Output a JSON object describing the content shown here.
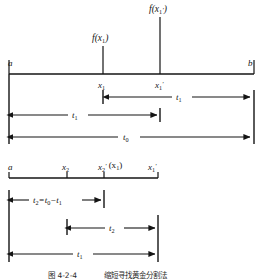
{
  "figure": {
    "caption_label": "图 4-2-4",
    "caption_text": "缩短寻找黄金分割法",
    "diagrams": [
      {
        "id": "upper-interval",
        "endpoints": {
          "left": "a",
          "right": "b"
        },
        "interior_points": [
          {
            "name": "x1",
            "base": "x",
            "sub": "1",
            "prime": ""
          },
          {
            "name": "x1-prime",
            "base": "x",
            "sub": "1",
            "prime": "′"
          }
        ],
        "function_labels": [
          {
            "name": "f-x1",
            "base": "f(x",
            "sub": "1",
            "prime": "",
            "close": ")"
          },
          {
            "name": "f-x1-prime",
            "base": "f(x",
            "sub": "1",
            "prime": "′",
            "close": ")"
          }
        ],
        "measures": [
          {
            "name": "t1-right",
            "base": "t",
            "sub": "1",
            "from": "x1",
            "to": "b"
          },
          {
            "name": "t1-left",
            "base": "t",
            "sub": "1",
            "from": "a",
            "to": "x1-prime"
          },
          {
            "name": "t0-full",
            "base": "t",
            "sub": "0",
            "from": "a",
            "to": "b"
          }
        ]
      },
      {
        "id": "lower-interval",
        "endpoints": {
          "left": "a",
          "right": "x1-prime"
        },
        "interior_points": [
          {
            "name": "x2",
            "base": "x",
            "sub": "2",
            "prime": ""
          },
          {
            "name": "x2-prime",
            "base": "x",
            "sub": "2",
            "prime": "′",
            "annotation": "(x₁)"
          },
          {
            "name": "x1-prime",
            "base": "x",
            "sub": "1",
            "prime": "′"
          }
        ],
        "measures": [
          {
            "name": "t2-equation",
            "text": "t₂=t₀−t₁",
            "from": "a",
            "to": "x2-prime"
          },
          {
            "name": "t2-span",
            "base": "t",
            "sub": "2",
            "from": "x2",
            "to": "x1-prime"
          },
          {
            "name": "t1-span",
            "base": "t",
            "sub": "1",
            "from": "a",
            "to": "x1-prime"
          }
        ]
      }
    ]
  },
  "text": {
    "a": "a",
    "b": "b",
    "f_open": "f(x",
    "close_paren": ")",
    "prime": "′",
    "t": "t",
    "x": "x",
    "sub_0": "0",
    "sub_1": "1",
    "sub_2": "2",
    "t2_equation_main": "t",
    "t2_equation_rest": "=t",
    "t2_equation_minus": "−t",
    "paren_x1_open": "(x",
    "paren_close": ")",
    "caption_label": "图 4-2-4",
    "caption_text": "缩短寻找黄金分割法"
  }
}
